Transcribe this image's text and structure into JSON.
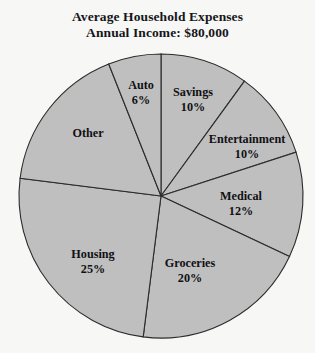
{
  "chart_data": {
    "type": "pie",
    "title": "Average Household Expenses",
    "subtitle": "Annual Income: $80,000",
    "xlabel": "",
    "ylabel": "",
    "legend_position": "none",
    "grid": false,
    "start_angle_deg": 0,
    "direction": "clockwise",
    "total_labeled_percent": 83,
    "categories": [
      "Savings",
      "Entertainment",
      "Medical",
      "Groceries",
      "Housing",
      "Other",
      "Auto"
    ],
    "values": [
      10,
      10,
      12,
      20,
      25,
      17,
      6
    ],
    "value_labels": [
      "10%",
      "10%",
      "12%",
      "20%",
      "25%",
      "",
      "6%"
    ],
    "slices": [
      {
        "name": "Savings",
        "percent": 10,
        "label": "Savings",
        "value_text": "10%",
        "label_x": 193,
        "label_y": 99,
        "color": "#bfbfbf"
      },
      {
        "name": "Entertainment",
        "percent": 10,
        "label": "Entertainment",
        "value_text": "10%",
        "label_x": 247,
        "label_y": 146,
        "color": "#bfbfbf"
      },
      {
        "name": "Medical",
        "percent": 12,
        "label": "Medical",
        "value_text": "12%",
        "label_x": 241,
        "label_y": 203,
        "color": "#bfbfbf"
      },
      {
        "name": "Groceries",
        "percent": 20,
        "label": "Groceries",
        "value_text": "20%",
        "label_x": 190,
        "label_y": 270,
        "color": "#bfbfbf"
      },
      {
        "name": "Housing",
        "percent": 25,
        "label": "Housing",
        "value_text": "25%",
        "label_x": 93,
        "label_y": 261,
        "color": "#bfbfbf"
      },
      {
        "name": "Other",
        "percent": 17,
        "label": "Other",
        "value_text": "",
        "label_x": 88,
        "label_y": 133,
        "color": "#bfbfbf"
      },
      {
        "name": "Auto",
        "percent": 6,
        "label": "Auto",
        "value_text": "6%",
        "label_x": 141,
        "label_y": 92,
        "color": "#bfbfbf"
      }
    ],
    "geometry": {
      "center_x": 161,
      "center_y": 196,
      "radius": 142
    },
    "colors": {
      "slice_fill": "#bfbfbf",
      "slice_stroke": "#2b2b2b",
      "background": "#f7f7f5",
      "text": "#101014"
    }
  }
}
